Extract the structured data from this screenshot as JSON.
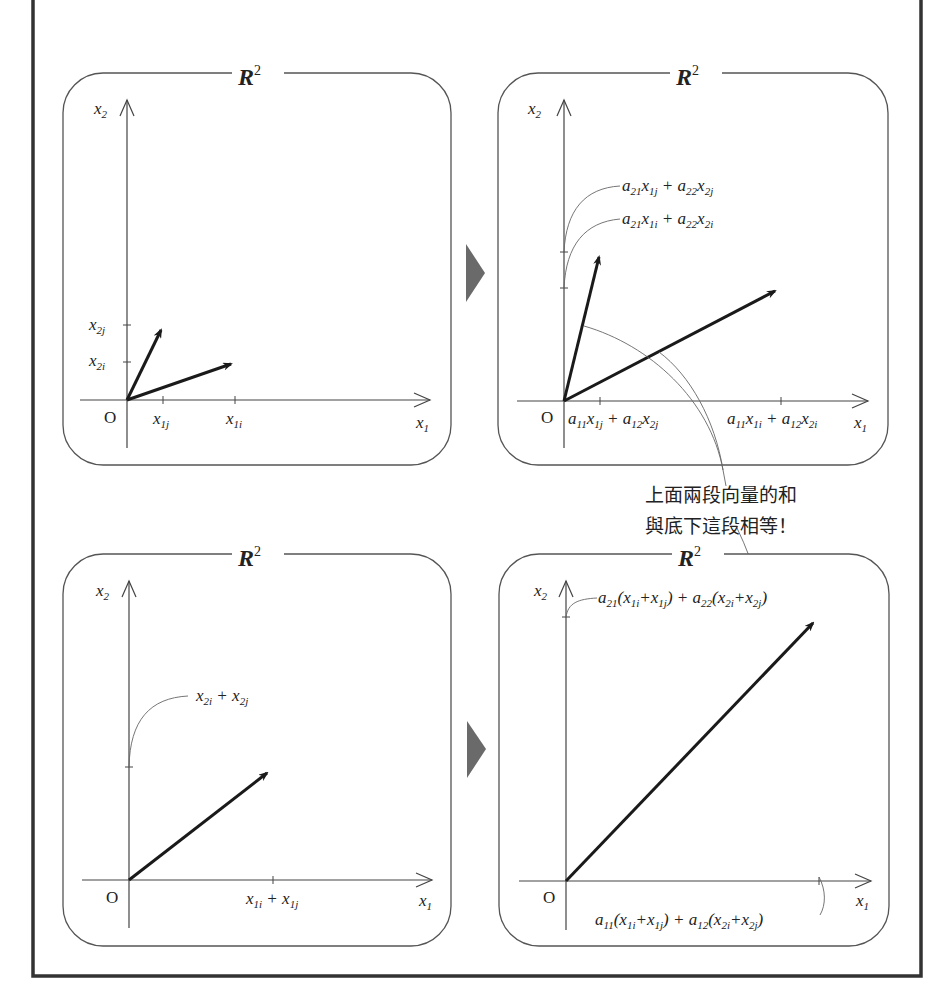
{
  "diagram": {
    "space_label": "R",
    "space_sup": "2",
    "note_lines": [
      "上面兩段向量的和",
      "與底下這段相等！"
    ],
    "colors": {
      "frame": "#333333",
      "panel_border": "#555555",
      "vector": "#1a1a1a",
      "arrow_marker": "#6a6a6a"
    },
    "panels": [
      {
        "id": "top-left",
        "origin": "O",
        "x_axis": {
          "var": "x",
          "sub": "1"
        },
        "y_axis": {
          "var": "x",
          "sub": "2"
        },
        "tick_labels": {
          "x2j": {
            "var": "x",
            "sub": "2j"
          },
          "x2i": {
            "var": "x",
            "sub": "2i"
          },
          "x1j": {
            "var": "x",
            "sub": "1j"
          },
          "x1i": {
            "var": "x",
            "sub": "1i"
          }
        }
      },
      {
        "id": "top-right",
        "origin": "O",
        "x_axis": {
          "var": "x",
          "sub": "1"
        },
        "y_axis": {
          "var": "x",
          "sub": "2"
        },
        "labels": {
          "y_j": "a21x1j + a22x2j",
          "y_i": "a21x1i + a22x2i",
          "x_j": "a11x1j + a12x2j",
          "x_i": "a11x1i + a12x2i"
        }
      },
      {
        "id": "bottom-left",
        "origin": "O",
        "x_axis": {
          "var": "x",
          "sub": "1"
        },
        "y_axis": {
          "var": "x",
          "sub": "2"
        },
        "labels": {
          "y_sum": "x2i + x2j",
          "x_sum": "x1i + x1j"
        }
      },
      {
        "id": "bottom-right",
        "origin": "O",
        "x_axis": {
          "var": "x",
          "sub": "1"
        },
        "y_axis": {
          "var": "x",
          "sub": "2"
        },
        "labels": {
          "y_sum": "a21(x1i+x1j) + a22(x2i+x2j)",
          "x_sum": "a11(x1i+x1j) + a12(x2i+x2j)"
        }
      }
    ]
  }
}
